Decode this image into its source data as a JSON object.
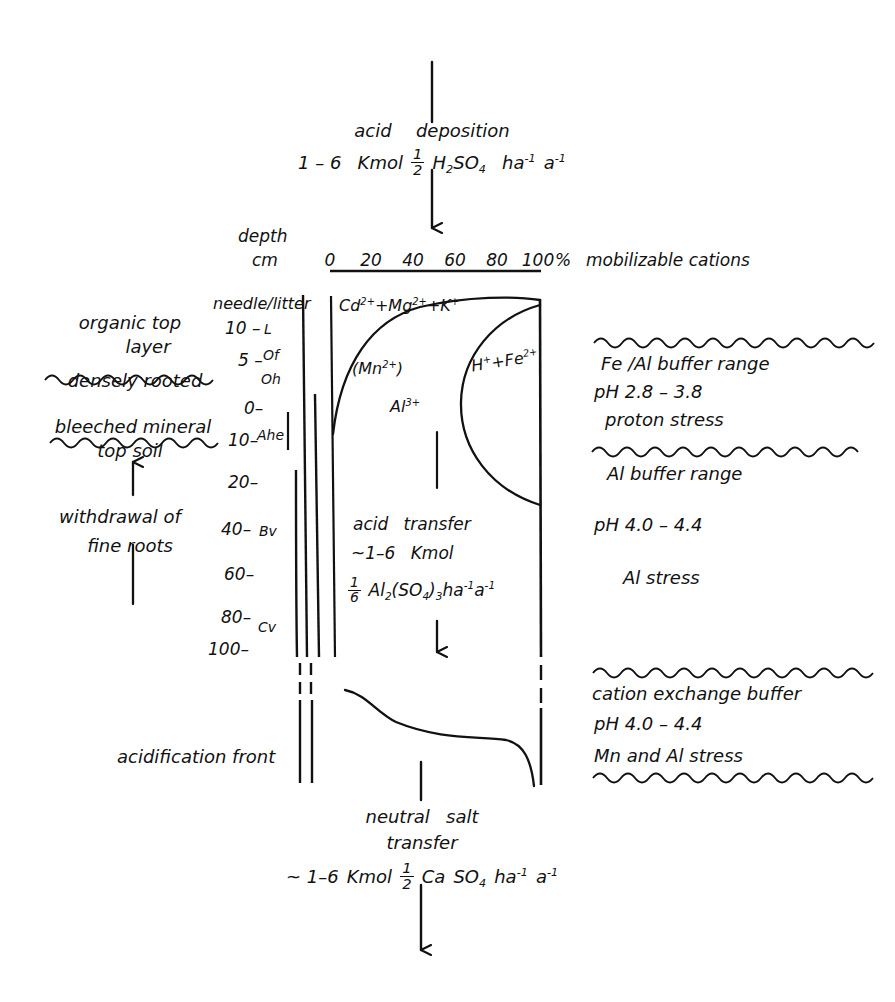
{
  "figure": {
    "type": "diagram"
  },
  "top_flow": {
    "line1": "acid",
    "line1b": "deposition",
    "line2_pre": "1 – 6",
    "line2_unit": "Kmol",
    "line2_frac_num": "1",
    "line2_frac_den": "2",
    "line2_species_a": "H",
    "line2_species_a_sub": "2",
    "line2_species_b": "SO",
    "line2_species_b_sub": "4",
    "line2_rate_a": "ha",
    "line2_rate_a_sup": "-1",
    "line2_rate_b": "a",
    "line2_rate_b_sup": "-1"
  },
  "axis": {
    "depth_label": "depth",
    "unit_label": "cm",
    "ticks": [
      "0",
      "20",
      "40",
      "60",
      "80",
      "100"
    ],
    "percent": "%",
    "axis_title": "mobilizable cations"
  },
  "depth_scale": [
    {
      "label": "needle/litter",
      "horizon": ""
    },
    {
      "label": "10 –",
      "horizon": "L"
    },
    {
      "label": "5 –",
      "horizon": "Of"
    },
    {
      "label": "",
      "horizon": "Oh"
    },
    {
      "label": "0–",
      "horizon": ""
    },
    {
      "label": "10–",
      "horizon": "Ahe"
    },
    {
      "label": "20–",
      "horizon": ""
    },
    {
      "label": "40–",
      "horizon": "Bv"
    },
    {
      "label": "60–",
      "horizon": ""
    },
    {
      "label": "80–",
      "horizon": ""
    },
    {
      "label": "100–",
      "horizon": "Cv"
    }
  ],
  "left_annotations": {
    "organic_line1": "organic top",
    "organic_line2": "layer",
    "densely_rooted": "densely rooted",
    "bleeched_line1": "bleeched mineral",
    "bleeched_line2": "top soil",
    "withdrawal_line1": "withdrawal of",
    "withdrawal_line2": "fine roots",
    "acidification_front": "acidification front"
  },
  "plot_species": {
    "base_cations": "Cd",
    "base_cations_sup1": "2+",
    "base_cations_mid": "+Mg",
    "base_cations_sup2": "2+",
    "base_cations_tail": "+K",
    "base_cations_sup3": "+",
    "manganese": "(Mn",
    "manganese_sup": "2+",
    "manganese_tail": ")",
    "aluminium": "Al",
    "aluminium_sup": "3+",
    "proton_iron": "H",
    "proton_iron_sup1": "+",
    "proton_iron_mid": "+Fe",
    "proton_iron_sup2": "2+"
  },
  "acid_transfer": {
    "line1a": "acid",
    "line1b": "transfer",
    "line2": "~1–6",
    "line2b": "Kmol",
    "frac_num": "1",
    "frac_den": "6",
    "formula_a": "Al",
    "formula_a_sub": "2",
    "formula_b": "(SO",
    "formula_b_sub": "4",
    "formula_c": ")",
    "formula_c_sub": "3",
    "rate_a": "ha",
    "rate_a_sup": "-1",
    "rate_b": "a",
    "rate_b_sup": "-1"
  },
  "right_annotations": {
    "fe_al_buffer": "Fe /Al  buffer range",
    "fe_al_ph": "pH  2.8  –  3.8",
    "fe_al_stress": "proton  stress",
    "al_buffer": "Al   buffer range",
    "al_ph": "pH  4.0  –  4.4",
    "al_stress": "Al   stress",
    "cec_buffer": "cation exchange buffer",
    "cec_ph": "pH  4.0  –  4.4",
    "cec_stress": "Mn and Al stress"
  },
  "bottom_flow": {
    "line1a": "neutral",
    "line1b": "salt",
    "line2": "transfer",
    "line3_pre": "~ 1–6",
    "line3_unit": "Kmol",
    "frac_num": "1",
    "frac_den": "2",
    "species_a": "Ca",
    "species_b": "SO",
    "species_b_sub": "4",
    "rate_a": "ha",
    "rate_a_sup": "-1",
    "rate_b": "a",
    "rate_b_sup": "-1"
  },
  "colors": {
    "ink": "#111111",
    "background": "#ffffff"
  }
}
